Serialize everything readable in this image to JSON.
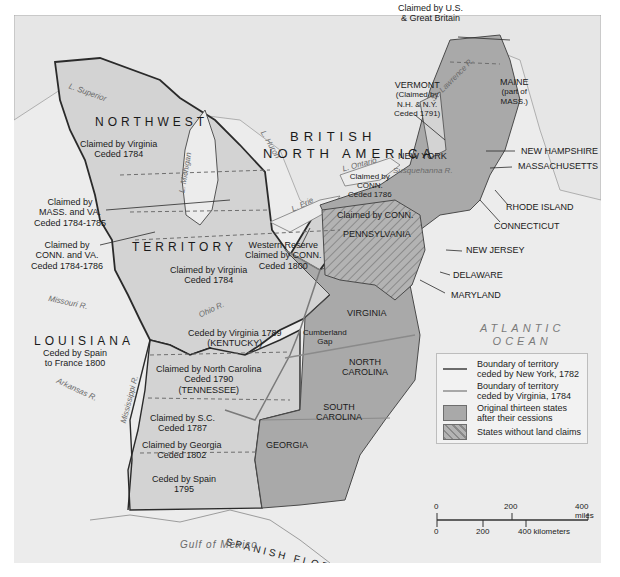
{
  "map": {
    "regions": {
      "british_north_america": "BRITISH NORTH AMERICA",
      "british_line1": "BRITISH",
      "british_line2": "NORTH AMERICA",
      "northwest": "NORTHWEST",
      "territory": "TERRITORY",
      "louisiana": "LOUISIANA",
      "spanish_florida": "SPANISH FLORIDA"
    },
    "claims": {
      "us_gb_line1": "Claimed by U.S.",
      "us_gb_line2": "& Great Britain",
      "virginia_nw_line1": "Claimed by Virginia",
      "virginia_nw_line2": "Ceded 1784",
      "mass_va_line1": "Claimed by",
      "mass_va_line2": "MASS. and VA.",
      "mass_va_line3": "Ceded 1784-1785",
      "conn_va_line1": "Claimed by",
      "conn_va_line2": "CONN. and VA.",
      "conn_va_line3": "Ceded 1784-1786",
      "western_reserve_line1": "Western Reserve",
      "western_reserve_line2": "Claimed by CONN.",
      "western_reserve_line3": "Ceded 1800",
      "virginia_ohio_line1": "Claimed by Virginia",
      "virginia_ohio_line2": "Ceded 1784",
      "kentucky_line1": "Ceded by Virginia 1789",
      "kentucky_line2": "(KENTUCKY)",
      "tennessee_line1": "Claimed by North Carolina",
      "tennessee_line2": "Ceded 1790",
      "tennessee_line3": "(TENNESSEE)",
      "sc_line1": "Claimed by S.C.",
      "sc_line2": "Ceded 1787",
      "georgia_line1": "Claimed by Georgia",
      "georgia_line2": "Ceded 1802",
      "spain_line1": "Ceded by Spain",
      "spain_line2": "1795",
      "louisiana_line1": "Ceded by Spain",
      "louisiana_line2": "to France 1800",
      "conn_ny_line1": "Claimed by",
      "conn_ny_line2": "CONN.",
      "conn_ny_line3": "Ceded 1786",
      "conn_pa": "Claimed by CONN.",
      "vermont_line1": "VERMONT",
      "vermont_line2": "(Claimed by",
      "vermont_line3": "N.H. & N.Y.",
      "vermont_line4": "Ceded 1791)"
    },
    "states": {
      "maine_line1": "MAINE",
      "maine_line2": "(part of",
      "maine_line3": "MASS.)",
      "new_york": "NEW YORK",
      "new_hampshire": "NEW HAMPSHIRE",
      "massachusetts": "MASSACHUSETTS",
      "rhode_island": "RHODE ISLAND",
      "connecticut": "CONNECTICUT",
      "pennsylvania": "PENNSYLVANIA",
      "new_jersey": "NEW JERSEY",
      "delaware": "DELAWARE",
      "maryland": "MARYLAND",
      "virginia": "VIRGINIA",
      "north_carolina_line1": "NORTH",
      "north_carolina_line2": "CAROLINA",
      "south_carolina_line1": "SOUTH",
      "south_carolina_line2": "CAROLINA",
      "georgia": "GEORGIA"
    },
    "water": {
      "superior": "L. Superior",
      "michigan": "L. Michigan",
      "huron": "L. Huron",
      "erie": "L. Erie",
      "ontario": "L. Ontario",
      "st_lawrence": "St. Lawrence R.",
      "susquehanna": "Susquehanna R.",
      "ohio": "Ohio R.",
      "missouri": "Missouri R.",
      "arkansas": "Arkansas R.",
      "mississippi": "Mississippi R.",
      "atlantic_line1": "ATLANTIC",
      "atlantic_line2": "OCEAN",
      "gulf": "Gulf of Mexico"
    },
    "features": {
      "cumberland_line1": "Cumberland",
      "cumberland_line2": "Gap"
    },
    "colors": {
      "background": "#ececec",
      "territory": "#d3d3d3",
      "original_states": "#a9a9a9",
      "border_dark": "#2a2a2a",
      "ny_boundary": "#6b6b6b",
      "va_boundary": "#9a9a9a",
      "water_text": "#6a6a6a"
    }
  },
  "legend": {
    "items": [
      {
        "type": "line",
        "color": "#6b6b6b",
        "label_line1": "Boundary of territory",
        "label_line2": "ceded by New York, 1782"
      },
      {
        "type": "line",
        "color": "#a8a8a8",
        "label_line1": "Boundary of territory",
        "label_line2": "ceded by Virginia, 1784"
      },
      {
        "type": "fill",
        "color": "#a9a9a9",
        "label_line1": "Original thirteen states",
        "label_line2": "after their cessions"
      },
      {
        "type": "hatch",
        "color": "#a9a9a9",
        "label_line1": "States without land claims",
        "label_line2": ""
      }
    ]
  },
  "scale_bar": {
    "miles": [
      "0",
      "200",
      "400 miles"
    ],
    "kilometers": [
      "0",
      "200",
      "400 kilometers"
    ]
  }
}
